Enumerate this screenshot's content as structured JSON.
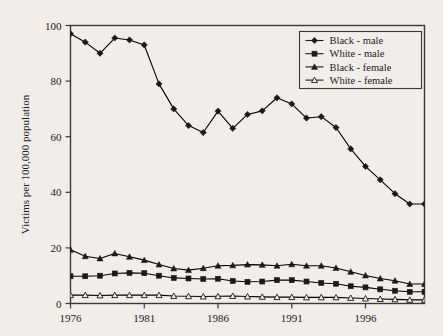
{
  "chart_data": {
    "type": "line",
    "title": "",
    "subtitle": "",
    "xlabel": "",
    "ylabel": "Victims per 100,000 population",
    "xlim": [
      1976,
      2000
    ],
    "ylim": [
      0,
      100
    ],
    "grid": false,
    "legend_position": "top-right",
    "x": [
      1976,
      1977,
      1978,
      1979,
      1980,
      1981,
      1982,
      1983,
      1984,
      1985,
      1986,
      1987,
      1988,
      1989,
      1990,
      1991,
      1992,
      1993,
      1994,
      1995,
      1996,
      1997,
      1998,
      1999,
      2000
    ],
    "x_tick_labels": [
      "1976",
      "1981",
      "1986",
      "1991",
      "1996"
    ],
    "x_tick_values": [
      1976,
      1981,
      1986,
      1991,
      1996
    ],
    "y_tick_labels": [
      "0",
      "20",
      "40",
      "60",
      "80",
      "100"
    ],
    "y_tick_values": [
      0,
      20,
      40,
      60,
      80,
      100
    ],
    "series": [
      {
        "name": "Black - male",
        "marker": "diamond-filled",
        "color": "#000000",
        "values": [
          97.0,
          94.0,
          90.0,
          95.5,
          94.8,
          93.0,
          79.0,
          70.0,
          64.0,
          61.5,
          69.2,
          63.0,
          68.0,
          69.3,
          74.0,
          71.8,
          66.7,
          67.2,
          63.3,
          55.6,
          49.3,
          44.5,
          39.5,
          35.8,
          35.8
        ]
      },
      {
        "name": "White - male",
        "marker": "square-filled",
        "color": "#000000",
        "values": [
          9.8,
          9.8,
          10.0,
          10.8,
          11.0,
          10.9,
          10.0,
          9.2,
          9.0,
          8.8,
          8.9,
          8.1,
          7.8,
          7.9,
          8.4,
          8.4,
          7.9,
          7.4,
          7.1,
          6.2,
          5.8,
          5.1,
          4.6,
          4.2,
          4.2
        ]
      },
      {
        "name": "Black - female",
        "marker": "triangle-filled",
        "color": "#000000",
        "values": [
          19.3,
          17.0,
          16.2,
          18.0,
          16.8,
          15.6,
          14.0,
          12.6,
          12.0,
          12.7,
          13.6,
          13.7,
          14.0,
          13.9,
          13.6,
          14.1,
          13.6,
          13.6,
          12.8,
          11.4,
          10.1,
          9.0,
          8.2,
          7.0,
          7.0
        ]
      },
      {
        "name": "White - female",
        "marker": "triangle-open",
        "color": "#000000",
        "values": [
          3.0,
          3.0,
          2.9,
          3.0,
          3.0,
          3.0,
          3.0,
          2.7,
          2.6,
          2.5,
          2.6,
          2.7,
          2.5,
          2.4,
          2.3,
          2.3,
          2.2,
          2.2,
          2.2,
          2.0,
          1.8,
          1.6,
          1.5,
          1.3,
          1.3
        ]
      }
    ]
  },
  "legend": {
    "entries": [
      {
        "label": "Black - male"
      },
      {
        "label": "White - male"
      },
      {
        "label": "Black - female"
      },
      {
        "label": "White - female"
      }
    ]
  },
  "style": {
    "background": "#f1eee9",
    "axis_color": "#3a3a3a",
    "line_color": "#1a1a1a"
  }
}
